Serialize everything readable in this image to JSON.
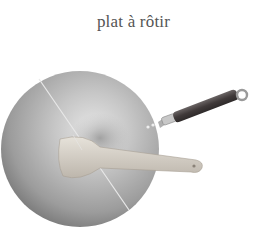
{
  "caption": {
    "text": "plat à rôtir"
  },
  "illustration": {
    "subject": "wok-with-spatula",
    "colors": {
      "pan_light": "#d8d8d8",
      "pan_mid": "#a9a9a9",
      "pan_dark": "#6e6e6e",
      "handle": "#4a4545",
      "spatula": "#d9d4cc",
      "background": "#ffffff"
    }
  }
}
